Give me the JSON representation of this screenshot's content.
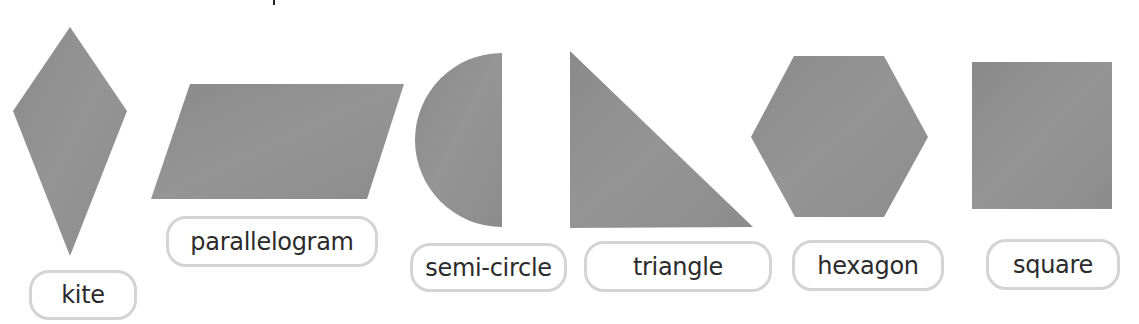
{
  "figure": {
    "shape_fill_color": "#8f8f8f",
    "label_border_color": "#d4d4d4",
    "text_color": "#2b2b2b"
  },
  "shapes": [
    {
      "name": "kite",
      "label": "kite"
    },
    {
      "name": "parallelogram",
      "label": "parallelogram"
    },
    {
      "name": "semi-circle",
      "label": "semi-circle"
    },
    {
      "name": "triangle",
      "label": "triangle"
    },
    {
      "name": "hexagon",
      "label": "hexagon"
    },
    {
      "name": "square",
      "label": "square"
    }
  ]
}
